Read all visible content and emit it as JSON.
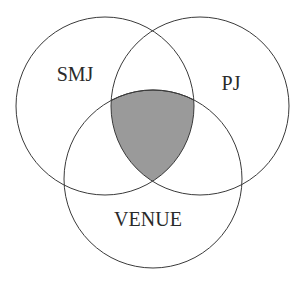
{
  "diagram": {
    "type": "venn",
    "sets": [
      {
        "id": "smj",
        "label": "SMJ",
        "cx": 105,
        "cy": 106,
        "r": 89,
        "label_x": 75,
        "label_y": 81
      },
      {
        "id": "pj",
        "label": "PJ",
        "cx": 200,
        "cy": 106,
        "r": 89,
        "label_x": 231,
        "label_y": 90
      },
      {
        "id": "venue",
        "label": "VENUE",
        "cx": 153,
        "cy": 179,
        "r": 89,
        "label_x": 148,
        "label_y": 226
      }
    ],
    "highlighted_region": {
      "description": "SMJ ∩ PJ ∩ VENUE",
      "fill": "#9a9a9a"
    },
    "colors": {
      "stroke": "#3a3a3a",
      "text": "#2a2a2a",
      "background": "#ffffff"
    }
  }
}
